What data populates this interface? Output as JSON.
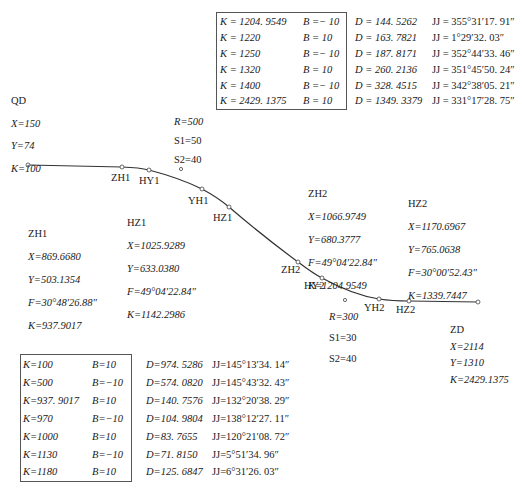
{
  "diagram": {
    "type": "road_alignment_curve",
    "start": {
      "name": "QD",
      "X": "X=150",
      "Y": "Y=74",
      "K": "K=100"
    },
    "end": {
      "name": "ZD",
      "X": "X=2114",
      "Y": "Y=1310",
      "K": "K=2429.1375"
    },
    "curve1": {
      "R": "R=500",
      "S1": "S1=50",
      "S2": "S2=40",
      "points": [
        "ZH1",
        "HY1",
        "YH1",
        "HZ1"
      ],
      "ZH1": {
        "name": "ZH1",
        "X": "X=869.6680",
        "Y": "Y=503.1354",
        "F": "F=30°48′26.88″",
        "K": "K=937.9017"
      },
      "HZ1": {
        "name": "HZ1",
        "X": "X=1025.9289",
        "Y": "Y=633.0380",
        "F": "F=49°04′22.84″",
        "K": "K=1142.2986"
      }
    },
    "curve2": {
      "R": "R=300",
      "S1": "S1=30",
      "S2": "S2=40",
      "points": [
        "ZH2",
        "HY2",
        "YH2",
        "HZ2"
      ],
      "ZH2": {
        "name": "ZH2",
        "X": "X=1066.9749",
        "Y": "Y=680.3777",
        "F": "F=49°04′22.84″",
        "K": "K=1204.9549"
      },
      "HZ2": {
        "name": "HZ2",
        "X": "X=1170.6967",
        "Y": "Y=765.0638",
        "F": "F=30°00′52.43″",
        "K": "K=1339.7447"
      }
    },
    "labels": {
      "ZH1": "ZH1",
      "HY1": "HY1",
      "YH1": "YH1",
      "HZ1": "HZ1",
      "ZH2": "ZH2",
      "HY2": "HY2",
      "YH2": "YH2",
      "HZ2": "HZ2"
    }
  },
  "table_top": {
    "rows": [
      {
        "K": "K = 1204. 9549",
        "B": "B =− 10",
        "D": "D = 144. 5262",
        "JJ": "JJ = 355°31′17. 91″"
      },
      {
        "K": "K = 1220",
        "B": "B = 10",
        "D": "D = 163. 7821",
        "JJ": "JJ = 1°29′32. 03″"
      },
      {
        "K": "K = 1250",
        "B": "B =− 10",
        "D": "D = 187. 8171",
        "JJ": "JJ = 352°44′33. 46″"
      },
      {
        "K": "K = 1320",
        "B": "B = 10",
        "D": "D = 260. 2136",
        "JJ": "JJ = 351°45′50. 24″"
      },
      {
        "K": "K = 1400",
        "B": "B =− 10",
        "D": "D = 328. 4515",
        "JJ": "JJ = 342°38′05. 21″"
      },
      {
        "K": "K = 2429. 1375",
        "B": "B = 10",
        "D": "D = 1349. 3379",
        "JJ": "JJ = 331°17′28. 75″"
      }
    ]
  },
  "table_bottom": {
    "rows": [
      {
        "K": "K=100",
        "B": "B=10",
        "D": "D=974. 5286",
        "JJ": "JJ=145°13′34. 14″"
      },
      {
        "K": "K=500",
        "B": "B=−10",
        "D": "D=574. 0820",
        "JJ": "JJ=145°43′32. 43″"
      },
      {
        "K": "K=937. 9017",
        "B": "B=10",
        "D": "D=140. 7576",
        "JJ": "JJ=132°20′38. 29″"
      },
      {
        "K": "K=970",
        "B": "B=−10",
        "D": "D=104. 9804",
        "JJ": "JJ=138°12′27. 11″"
      },
      {
        "K": "K=1000",
        "B": "B=10",
        "D": "D=83. 7655",
        "JJ": "JJ=120°21′08. 72″"
      },
      {
        "K": "K=1130",
        "B": "B=−10",
        "D": "D=71. 8150",
        "JJ": "JJ=5°51′34. 96″"
      },
      {
        "K": "K=1180",
        "B": "B=10",
        "D": "D=125. 6847",
        "JJ": "JJ=6°31′26. 03″"
      }
    ]
  },
  "colors": {
    "line": "#333333",
    "box": "#555555",
    "text": "#1a1a1a"
  }
}
